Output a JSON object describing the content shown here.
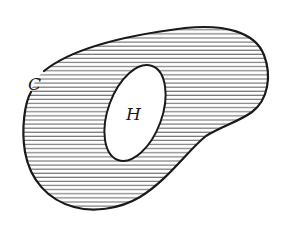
{
  "diagram": {
    "type": "region-with-hole",
    "outer_region": {
      "label": "C",
      "fill": "horizontal-hatch",
      "stroke_color": "#1a1a1a",
      "hatch_color": "#444444"
    },
    "hole": {
      "label": "H",
      "fill": "#ffffff",
      "stroke_color": "#1a1a1a"
    }
  }
}
